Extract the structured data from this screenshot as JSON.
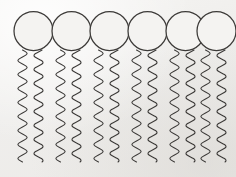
{
  "diagram": {
    "molecule_count": 6,
    "tails_per_molecule": 2,
    "total_tails": 12,
    "background_color": "#f2f1ef",
    "stroke_color": "#3c3a38",
    "head_fill_color": "#f4f3f1",
    "stroke_width": 1.1,
    "canvas": {
      "width": 236,
      "height": 177
    },
    "head": {
      "name": "hydrophilic-head",
      "shape": "circle",
      "radius": 19.5,
      "center_y": 31,
      "center_x_positions": [
        33.5,
        71.5,
        109.5,
        147.5,
        185.5,
        216.5
      ]
    },
    "tail": {
      "name": "hydrophobic-tail",
      "shape": "wavy-line",
      "top_y": 50,
      "bottom_y": 162,
      "wave_count": 8,
      "amplitude": 4.6,
      "left_offset_from_center": -11,
      "right_offset_from_center": 5
    },
    "molecules": [
      {
        "id": 1,
        "label": "phospholipid-1",
        "head_center_x": 33.5
      },
      {
        "id": 2,
        "label": "phospholipid-2",
        "head_center_x": 71.5
      },
      {
        "id": 3,
        "label": "phospholipid-3",
        "head_center_x": 109.5
      },
      {
        "id": 4,
        "label": "phospholipid-4",
        "head_center_x": 147.5
      },
      {
        "id": 5,
        "label": "phospholipid-5",
        "head_center_x": 185.5
      },
      {
        "id": 6,
        "label": "phospholipid-6",
        "head_center_x": 216.5
      }
    ]
  }
}
